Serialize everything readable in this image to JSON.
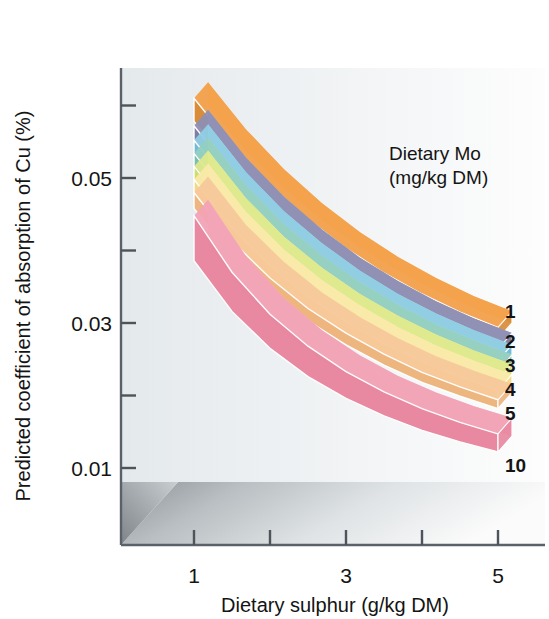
{
  "chart_data": {
    "type": "area",
    "title": "",
    "xlabel": "Dietary sulphur (g/kg DM)",
    "ylabel": "Predicted coefficient of absorption of Cu (%)",
    "xlim": [
      0.5,
      5.6
    ],
    "ylim": [
      0.004,
      0.062
    ],
    "x_ticks": [
      1,
      2,
      3,
      4,
      5
    ],
    "x_tick_labels": [
      "1",
      "",
      "3",
      "",
      "5"
    ],
    "y_ticks": [
      0.01,
      0.02,
      0.03,
      0.04,
      0.05,
      0.06
    ],
    "y_tick_labels": [
      "0.01",
      "",
      "0.03",
      "",
      "0.05",
      ""
    ],
    "grid": false,
    "legend_position": "upper-right-inside",
    "legend_title": "Dietary Mo (mg/kg DM)",
    "style": "pseudo-3d ribbon bands on shaded floor",
    "x": [
      1,
      1.5,
      2,
      2.5,
      3,
      3.5,
      4,
      4.5,
      5
    ],
    "series": [
      {
        "name": "1",
        "label": "1",
        "color": "#f3a04a",
        "top_color": "#f6b878",
        "side_color": "#d98a33",
        "values": [
          0.061,
          0.0545,
          0.049,
          0.0443,
          0.0403,
          0.0369,
          0.034,
          0.0315,
          0.0294
        ],
        "lower_values": [
          0.0578,
          0.0516,
          0.0464,
          0.042,
          0.0382,
          0.035,
          0.0322,
          0.0298,
          0.0278
        ]
      },
      {
        "name": "2",
        "label": "2",
        "color": "#8e8fb4",
        "top_color": "#a5a6c7",
        "side_color": "#7a7ba3",
        "values": [
          0.0572,
          0.0506,
          0.0452,
          0.0407,
          0.0368,
          0.0336,
          0.0308,
          0.0284,
          0.0264
        ],
        "lower_values": [
          0.0548,
          0.0484,
          0.0431,
          0.0387,
          0.035,
          0.0319,
          0.0292,
          0.0269,
          0.025
        ]
      },
      {
        "name": "3",
        "label": "3",
        "color": "#8fcde4",
        "top_color": "#aedcee",
        "side_color": "#6fb9d6",
        "values": [
          0.0552,
          0.0486,
          0.0432,
          0.0388,
          0.035,
          0.0318,
          0.0291,
          0.0268,
          0.0248
        ],
        "lower_values": [
          0.053,
          0.0465,
          0.0412,
          0.0369,
          0.0333,
          0.0302,
          0.0276,
          0.0254,
          0.0235
        ]
      },
      {
        "name": "4",
        "label": "4",
        "color": "#93cfc0",
        "top_color": "#b0ddd2",
        "side_color": "#76bfae",
        "values": [
          0.0534,
          0.0468,
          0.0414,
          0.0371,
          0.0334,
          0.0303,
          0.0276,
          0.0254,
          0.0234
        ],
        "lower_values": [
          0.0512,
          0.0447,
          0.0395,
          0.0353,
          0.0317,
          0.0287,
          0.0262,
          0.024,
          0.0222
        ]
      },
      {
        "name": "5",
        "label": "5",
        "color": "#dde98b",
        "top_color": "#e9f2ad",
        "side_color": "#cddd6c",
        "values": [
          0.0516,
          0.045,
          0.0397,
          0.0354,
          0.0318,
          0.0288,
          0.0262,
          0.024,
          0.0221
        ],
        "lower_values": [
          0.0494,
          0.0429,
          0.0377,
          0.0336,
          0.0301,
          0.0272,
          0.0247,
          0.0226,
          0.0208
        ]
      },
      {
        "name": "5b",
        "label": "",
        "color": "#f9e9a8",
        "top_color": "#fcf2c7",
        "side_color": "#f2d986",
        "values": [
          0.0498,
          0.0431,
          0.0379,
          0.0337,
          0.0302,
          0.0272,
          0.0247,
          0.0226,
          0.0207
        ],
        "lower_values": [
          0.0476,
          0.041,
          0.0359,
          0.0319,
          0.0285,
          0.0256,
          0.0232,
          0.0212,
          0.0194
        ]
      },
      {
        "name": "5c",
        "label": "",
        "color": "#f7c89a",
        "top_color": "#fadcbb",
        "side_color": "#eeb47c",
        "values": [
          0.048,
          0.0413,
          0.0362,
          0.032,
          0.0286,
          0.0257,
          0.0232,
          0.0212,
          0.0194
        ],
        "lower_values": [
          0.0458,
          0.0392,
          0.0342,
          0.0303,
          0.027,
          0.0242,
          0.0218,
          0.0199,
          0.0182
        ]
      },
      {
        "name": "10",
        "label": "10",
        "color": "#f2a3b6",
        "top_color": "#f6bccb",
        "side_color": "#e8869f",
        "values": [
          0.0448,
          0.037,
          0.0312,
          0.0268,
          0.0233,
          0.0205,
          0.0182,
          0.0163,
          0.0147
        ],
        "lower_values": [
          0.0386,
          0.0316,
          0.0265,
          0.0226,
          0.0196,
          0.0172,
          0.0152,
          0.0136,
          0.0122
        ]
      }
    ]
  },
  "axes": {
    "y_title": "Predicted coefficient of absorption of Cu (%)",
    "x_title": "Dietary sulphur (g/kg DM)",
    "y_tick_labels": [
      {
        "text": "0.05",
        "value": 0.05
      },
      {
        "text": "0.03",
        "value": 0.03
      },
      {
        "text": "0.01",
        "value": 0.01
      }
    ],
    "x_tick_labels": [
      {
        "text": "1",
        "value": 1
      },
      {
        "text": "3",
        "value": 3
      },
      {
        "text": "5",
        "value": 5
      }
    ]
  },
  "legend": {
    "line1": "Dietary Mo",
    "line2": "(mg/kg DM)",
    "entries": [
      {
        "label": "1"
      },
      {
        "label": "2"
      },
      {
        "label": "3"
      },
      {
        "label": "4"
      },
      {
        "label": "5"
      },
      {
        "label": "10"
      }
    ]
  },
  "colors": {
    "floor_light": "#f2f4f5",
    "floor_dark": "#9aa0a4",
    "wall": "#e9edef",
    "axis": "#5b6168",
    "text": "#141414"
  }
}
